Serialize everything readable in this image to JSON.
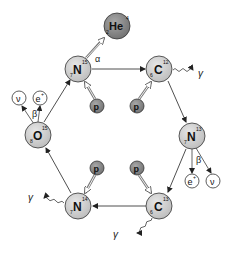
{
  "colors": {
    "nucleus_fill": "#cfcfcf",
    "heavy_fill": "#8a8a8a",
    "proton_fill": "#8a8a8a",
    "lepton_fill": "#ffffff",
    "stroke": "#333333"
  },
  "nuclei": [
    {
      "id": "n15",
      "symbol": "N",
      "mass": "15",
      "charge": "7"
    },
    {
      "id": "c12",
      "symbol": "C",
      "mass": "12",
      "charge": "6"
    },
    {
      "id": "n13",
      "symbol": "N",
      "mass": "13",
      "charge": "7"
    },
    {
      "id": "c13",
      "symbol": "C",
      "mass": "13",
      "charge": "6"
    },
    {
      "id": "n14",
      "symbol": "N",
      "mass": "14",
      "charge": "7"
    },
    {
      "id": "o15",
      "symbol": "O",
      "mass": "15",
      "charge": "8"
    },
    {
      "id": "he4",
      "symbol": "He",
      "mass": "4",
      "charge": "2"
    }
  ],
  "particles": {
    "proton": "p",
    "positron": "e",
    "positron_sup": "+",
    "neutrino": "ν",
    "gamma": "γ"
  },
  "decay_labels": {
    "alpha": "α",
    "beta": "β"
  }
}
